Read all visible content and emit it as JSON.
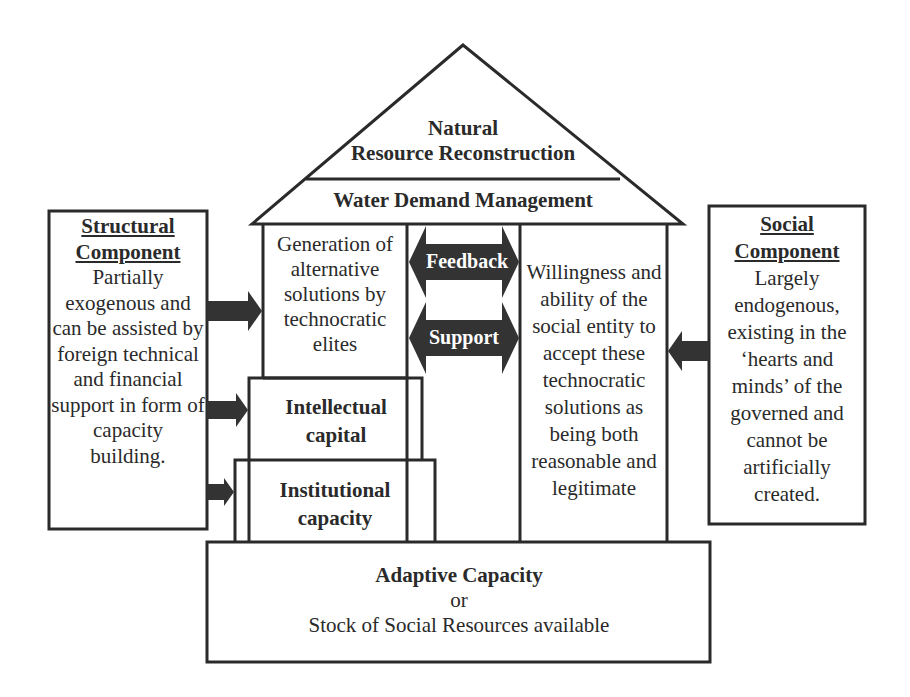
{
  "roof": {
    "top_label_line1": "Natural",
    "top_label_line2": "Resource Reconstruction",
    "band_label": "Water Demand Management"
  },
  "left_pillar": {
    "lines": [
      "Generation of",
      "alternative",
      "solutions by",
      "technocratic",
      "elites"
    ]
  },
  "right_pillar": {
    "lines": [
      "Willingness and",
      "ability of the",
      "social entity to",
      "accept these",
      "technocratic",
      "solutions as",
      "being both",
      "reasonable and",
      "legitimate"
    ]
  },
  "arrows": {
    "feedback": "Feedback",
    "support": "Support"
  },
  "steps": {
    "intellectual": [
      "Intellectual",
      "capital"
    ],
    "institutional": [
      "Institutional",
      "capacity"
    ]
  },
  "foundation": {
    "title": "Adaptive Capacity",
    "or": "or",
    "subtitle": "Stock of Social Resources available"
  },
  "structural": {
    "heading": [
      "Structural",
      "Component"
    ],
    "lines": [
      "Partially",
      "exogenous and",
      "can be assisted by",
      "foreign technical",
      "and financial",
      "support in form of",
      "capacity",
      "building."
    ]
  },
  "social": {
    "heading": [
      "Social",
      "Component"
    ],
    "lines": [
      "Largely",
      "endogenous,",
      "existing in the",
      "‘hearts and",
      "minds’ of the",
      "governed and",
      "cannot be",
      "artificially",
      "created."
    ]
  },
  "colors": {
    "line": "#2a2a2a",
    "arrow_fill": "#333333",
    "background": "#ffffff"
  }
}
